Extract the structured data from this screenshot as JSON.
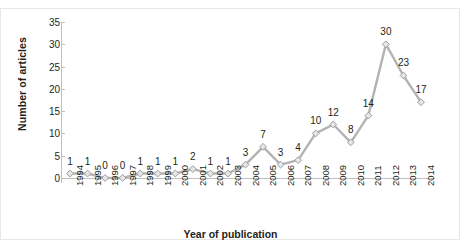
{
  "chart_data": {
    "type": "line",
    "title": "",
    "xlabel": "Year of publication",
    "ylabel": "Number of articles",
    "categories": [
      "1994",
      "1995",
      "1996",
      "1997",
      "1998",
      "1999",
      "2000",
      "2001",
      "2002",
      "2003",
      "2004",
      "2005",
      "2006",
      "2007",
      "2008",
      "2009",
      "2010",
      "2011",
      "2012",
      "2013",
      "2014"
    ],
    "values": [
      1,
      1,
      0,
      0,
      1,
      1,
      1,
      2,
      1,
      1,
      3,
      7,
      3,
      4,
      10,
      12,
      8,
      14,
      30,
      23,
      17
    ],
    "data_labels": [
      "1",
      "1",
      "0",
      "0",
      "1",
      "1",
      "1",
      "2",
      "1",
      "1",
      "3",
      "7",
      "3",
      "4",
      "10",
      "12",
      "8",
      "14",
      "30",
      "23",
      "17"
    ],
    "ylim": [
      0,
      35
    ],
    "yticks": [
      0,
      5,
      10,
      15,
      20,
      25,
      30,
      35
    ],
    "ytick_labels": [
      "0",
      "5",
      "10",
      "15",
      "20",
      "25",
      "30",
      "35"
    ],
    "grid": false,
    "legend": "none",
    "series_color": "#b3b3b3",
    "marker": "diamond",
    "marker_fill": "#e6e6e6",
    "marker_edge": "#9e9e9e",
    "axis_color": "#bfbfbf",
    "text_color": "#231f20"
  }
}
